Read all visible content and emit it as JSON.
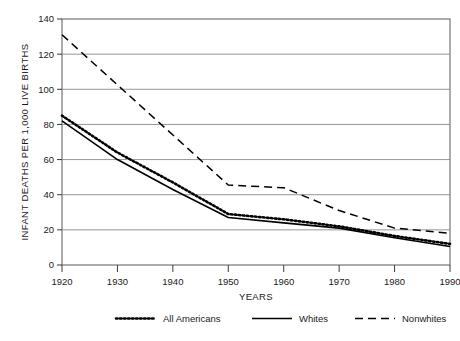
{
  "chart_data": {
    "type": "line",
    "title": "",
    "xlabel": "YEARS",
    "ylabel": "INFANT DEATHS PER 1,000 LIVE BIRTHS",
    "x": [
      1920,
      1930,
      1940,
      1950,
      1960,
      1970,
      1980,
      1990
    ],
    "xticklabels": [
      "1920",
      "1930",
      "1940",
      "1950",
      "1960",
      "1970",
      "1980",
      "1990"
    ],
    "yticklabels": [
      "0",
      "20",
      "40",
      "60",
      "80",
      "100",
      "120",
      "140"
    ],
    "yticks": [
      0,
      20,
      40,
      60,
      80,
      100,
      120,
      140
    ],
    "xlim": [
      1920,
      1990
    ],
    "ylim": [
      0,
      140
    ],
    "grid": "horizontal",
    "legend_position": "bottom",
    "series": [
      {
        "name": "All Americans",
        "style": "dotted",
        "color": "#000000",
        "x": [
          1920,
          1930,
          1940,
          1950,
          1960,
          1970,
          1980,
          1990
        ],
        "values": [
          85,
          64,
          47,
          29,
          26,
          22,
          16.5,
          12
        ]
      },
      {
        "name": "Whites",
        "style": "solid",
        "color": "#000000",
        "x": [
          1920,
          1930,
          1940,
          1950,
          1960,
          1970,
          1980,
          1990
        ],
        "values": [
          82,
          60,
          43,
          27,
          24,
          21,
          15.5,
          10.5
        ]
      },
      {
        "name": "Nonwhites",
        "style": "dashed",
        "color": "#000000",
        "x": [
          1920,
          1950,
          1960,
          1970,
          1980,
          1990
        ],
        "values": [
          131,
          45.5,
          44,
          31,
          21,
          18
        ]
      }
    ]
  },
  "legend": {
    "items": [
      {
        "label": "All Americans",
        "swatch": "dotted-line-swatch"
      },
      {
        "label": "Whites",
        "swatch": "solid-line-swatch"
      },
      {
        "label": "Nonwhites",
        "swatch": "dashed-line-swatch"
      }
    ]
  },
  "axes": {
    "y_title": "INFANT DEATHS PER 1,000 LIVE BIRTHS",
    "x_title": "YEARS"
  },
  "colors": {
    "ink": "#1a1a1a",
    "series": "#000000",
    "grid": "#808080",
    "frame": "#606060",
    "background": "#ffffff"
  }
}
